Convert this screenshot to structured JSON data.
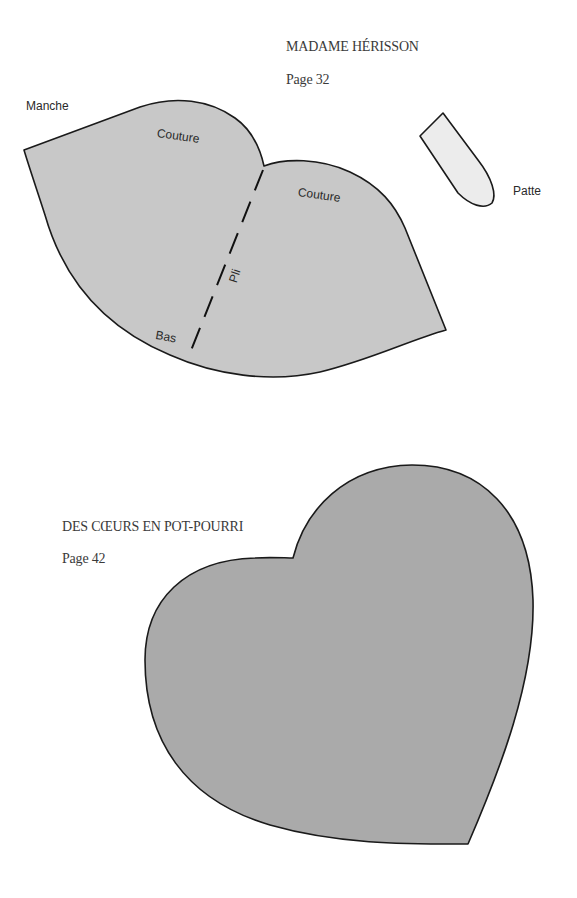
{
  "pattern_1": {
    "title": "MADAME HÉRISSON",
    "page": "Page 32",
    "labels": {
      "manche": "Manche",
      "couture_left": "Couture",
      "couture_right": "Couture",
      "pli": "Pli",
      "bas": "Bas",
      "patte": "Patte"
    },
    "colors": {
      "body_fill": "#c8c8c8",
      "patte_fill": "#ececec",
      "stroke": "#1a1a1a"
    }
  },
  "pattern_2": {
    "title": "DES CŒURS EN POT-POURRI",
    "page": "Page 42",
    "colors": {
      "heart_fill": "#aaaaaa",
      "stroke": "#1a1a1a"
    }
  }
}
